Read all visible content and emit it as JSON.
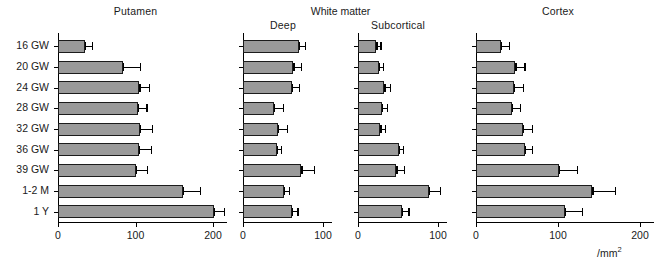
{
  "figure": {
    "group_title": "White matter",
    "unit_label": "/mm",
    "unit_exponent": "2",
    "categories": [
      "16 GW",
      "20 GW",
      "24 GW",
      "28 GW",
      "32 GW",
      "36 GW",
      "39 GW",
      "1-2 M",
      "1 Y"
    ],
    "bar_color": "#9a9a9a",
    "bar_edge_color": "#1c1c1c",
    "axis_color": "#000000"
  },
  "chart_data": {
    "type": "bar",
    "title": "",
    "orientation": "horizontal",
    "xlabel": "/mm2",
    "ylabel": "",
    "grid": false,
    "legend": "none",
    "categories": [
      "16 GW",
      "20 GW",
      "24 GW",
      "28 GW",
      "32 GW",
      "36 GW",
      "39 GW",
      "1-2 M",
      "1 Y"
    ],
    "panels": [
      {
        "name": "Putamen",
        "title": "Putamen",
        "xlim": [
          0,
          215
        ],
        "xticks": [
          0,
          100,
          200
        ],
        "xticklabels": [
          "0",
          "100",
          "200"
        ],
        "values": [
          35,
          84,
          105,
          103,
          106,
          104,
          100,
          161,
          201
        ],
        "errors": [
          9,
          22,
          12,
          11,
          15,
          16,
          15,
          22,
          13
        ]
      },
      {
        "name": "Deep",
        "title": "Deep",
        "group": "White matter",
        "xlim": [
          0,
          110
        ],
        "xticks": [
          0,
          100
        ],
        "xticklabels": [
          "0",
          "100"
        ],
        "values": [
          70,
          63,
          61,
          39,
          44,
          42,
          73,
          51,
          61
        ],
        "errors": [
          7,
          9,
          9,
          11,
          11,
          5,
          16,
          6,
          7
        ]
      },
      {
        "name": "Subcortical",
        "title": "Subcortical",
        "group": "White matter",
        "xlim": [
          0,
          110
        ],
        "xticks": [
          0,
          100
        ],
        "xticklabels": [
          "0",
          "100"
        ],
        "values": [
          23,
          26,
          33,
          30,
          28,
          51,
          48,
          89,
          55
        ],
        "errors": [
          5,
          5,
          7,
          6,
          6,
          5,
          9,
          13,
          8
        ]
      },
      {
        "name": "Cortex",
        "title": "Cortex",
        "xlim": [
          0,
          215
        ],
        "xticks": [
          0,
          100,
          200
        ],
        "xticklabels": [
          "0",
          "100",
          "200"
        ],
        "values": [
          30,
          48,
          46,
          44,
          57,
          60,
          101,
          142,
          108
        ],
        "errors": [
          10,
          11,
          11,
          10,
          11,
          8,
          22,
          27,
          21
        ]
      }
    ]
  }
}
